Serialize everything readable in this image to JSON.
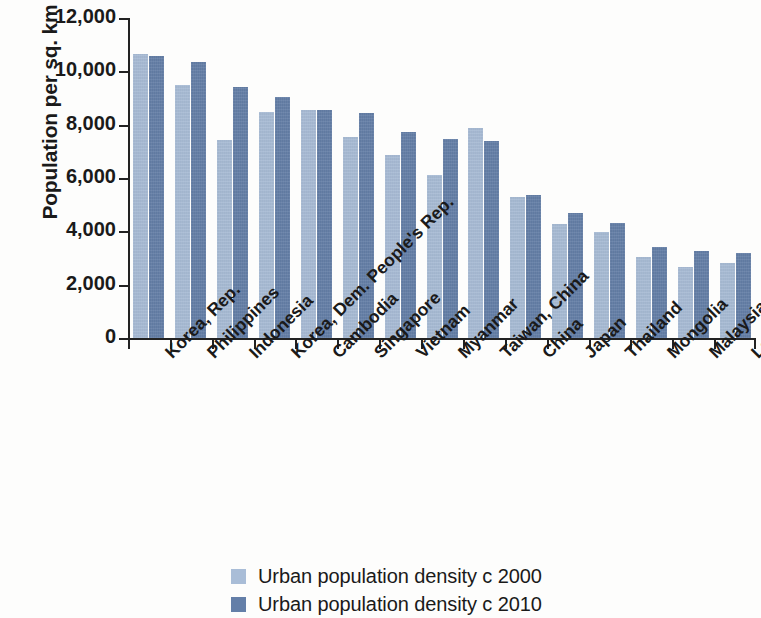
{
  "chart_data": {
    "type": "bar",
    "title": "",
    "xlabel": "",
    "ylabel": "Population per sq. km",
    "ylim": [
      0,
      12000
    ],
    "ytick_values": [
      0,
      2000,
      4000,
      6000,
      8000,
      10000,
      12000
    ],
    "ytick_labels": [
      "0",
      "2,000",
      "4,000",
      "6,000",
      "8,000",
      "10,000",
      "12,000"
    ],
    "grid": false,
    "legend_position": "bottom",
    "categories": [
      "Korea, Rep.",
      "Philippines",
      "Indonesia",
      "Korea, Dem. People's Rep.",
      "Cambodia",
      "Singapore",
      "Vietnam",
      "Myanmar",
      "Taiwan, China",
      "China",
      "Japan",
      "Thailand",
      "Mongolia",
      "Malaysia",
      "Lao PDR"
    ],
    "series": [
      {
        "name": "Urban population density c 2000",
        "color": "#a9bdd7",
        "values": [
          10650,
          9490,
          7430,
          8480,
          8540,
          7540,
          6860,
          6130,
          7860,
          5290,
          4280,
          3980,
          3050,
          2650,
          2830
        ]
      },
      {
        "name": "Urban population density c 2010",
        "color": "#647fa8",
        "values": [
          10560,
          10340,
          9420,
          9030,
          8550,
          8430,
          7720,
          7470,
          7370,
          5360,
          4700,
          4330,
          3400,
          3270,
          3180
        ]
      }
    ]
  },
  "legend": {
    "items": [
      {
        "label": "Urban population density c 2000",
        "swatch": "legend-swatch-2000"
      },
      {
        "label": "Urban population density c 2010",
        "swatch": "legend-swatch-2010"
      }
    ]
  },
  "colors": {
    "series_2000": "#a9bdd7",
    "series_2010": "#647fa8",
    "axis": "#222222",
    "background": "#fdfdfc"
  }
}
